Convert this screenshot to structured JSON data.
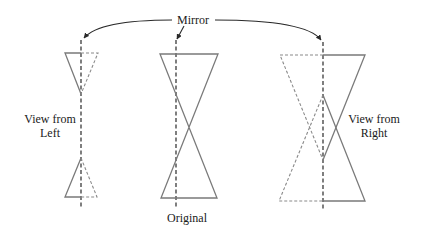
{
  "diagram": {
    "mirror_label": "Mirror",
    "left_label_line1": "View from",
    "left_label_line2": "Left",
    "right_label_line1": "View from",
    "right_label_line2": "Right",
    "original_label": "Original",
    "colors": {
      "solid_stroke": "#7a7a7a",
      "dashed_stroke": "#8a8a8a",
      "mirror_line": "#2a2a2a",
      "text": "#1a1a1a",
      "background": "#ffffff"
    }
  }
}
